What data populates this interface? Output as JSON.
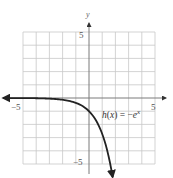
{
  "chart_data": {
    "type": "line",
    "title": "",
    "xlabel": "",
    "ylabel": "y",
    "xlim": [
      -5,
      5
    ],
    "ylim": [
      -5,
      5
    ],
    "grid": true,
    "x_ticks_labeled": [
      -5,
      5
    ],
    "y_ticks_labeled": [
      5,
      -5
    ],
    "tick_labels": {
      "x_neg": "−5",
      "x_pos": "5",
      "y_pos": "5",
      "y_neg": "−5"
    },
    "axis_names": {
      "y": "y"
    },
    "series": [
      {
        "name": "h(x) = −e^x",
        "function": "-exp(x)",
        "x": [
          -6.5,
          -5,
          -4,
          -3,
          -2,
          -1,
          -0.5,
          0,
          0.5,
          1,
          1.5,
          1.79
        ],
        "y": [
          -0.0015,
          -0.0067,
          -0.018,
          -0.05,
          -0.135,
          -0.368,
          -0.607,
          -1,
          -1.649,
          -2.718,
          -4.482,
          -6
        ],
        "arrows": [
          "left",
          "down"
        ]
      }
    ],
    "annotations": [
      {
        "text_parts": [
          "h",
          "(",
          "x",
          ") = −",
          "e",
          "x"
        ],
        "at": [
          3,
          -2
        ]
      }
    ]
  },
  "labels": {
    "y_axis": "y",
    "x_neg": "−5",
    "x_pos": "5",
    "y_pos": "5",
    "y_neg": "−5",
    "func_h": "h",
    "func_paren_open": "(",
    "func_x": "x",
    "func_mid": ") = −",
    "func_e": "e",
    "func_exp": "x"
  }
}
